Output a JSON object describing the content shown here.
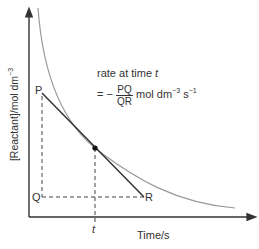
{
  "diagram": {
    "y_axis_label": "[Reactant]/mol dm",
    "y_axis_label_sup": "−3",
    "x_axis_label": "Time/s",
    "t_label": "t",
    "points": {
      "P": "P",
      "Q": "Q",
      "R": "R"
    },
    "annotation": {
      "line1": "rate at time ",
      "line1_var": "t",
      "eq_prefix": "= −",
      "frac_num": "PQ",
      "frac_den": "QR",
      "units_a": "mol dm",
      "units_a_sup": "−3",
      "units_b": " s",
      "units_b_sup": "−1"
    },
    "colors": {
      "axis": "#333333",
      "curve": "#9a9a9a",
      "tangent": "#333333",
      "dash": "#444444"
    }
  }
}
